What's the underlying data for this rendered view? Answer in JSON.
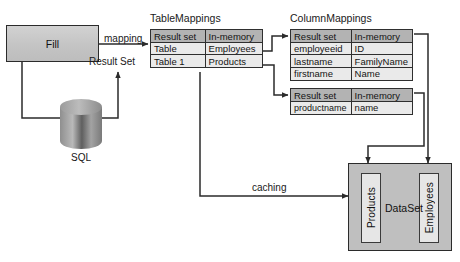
{
  "diagram": {
    "title_hidden": "ADO.NET Fill / Mappings / DataSet flow",
    "process": {
      "fill_label": "Fill"
    },
    "datasource": {
      "sql_label": "SQL"
    },
    "edges": {
      "mapping_label": "mapping",
      "result_set_label": "Result Set",
      "caching_label": "caching"
    },
    "table_mappings": {
      "caption": "TableMappings",
      "headers": [
        "Result set",
        "In-memory"
      ],
      "rows": [
        [
          "Table",
          "Employees"
        ],
        [
          "Table 1",
          "Products"
        ]
      ]
    },
    "column_mappings": {
      "caption": "ColumnMappings",
      "tables": [
        {
          "headers": [
            "Result set",
            "In-memory"
          ],
          "rows": [
            [
              "employeeid",
              "ID"
            ],
            [
              "lastname",
              "FamilyName"
            ],
            [
              "firstname",
              "Name"
            ]
          ]
        },
        {
          "headers": [
            "Result set",
            "In-memory"
          ],
          "rows": [
            [
              "productname",
              "name"
            ]
          ]
        }
      ]
    },
    "dataset": {
      "label": "DataSet",
      "tables": [
        "Products",
        "Employees"
      ]
    },
    "colors": {
      "box_fill": "#c6c6c6",
      "header_fill": "#b3b3b3",
      "cell_fill": "#eaeaea",
      "dataset_fill": "#bfbfbf",
      "stroke": "#2b2b2b",
      "text": "#141414"
    }
  }
}
